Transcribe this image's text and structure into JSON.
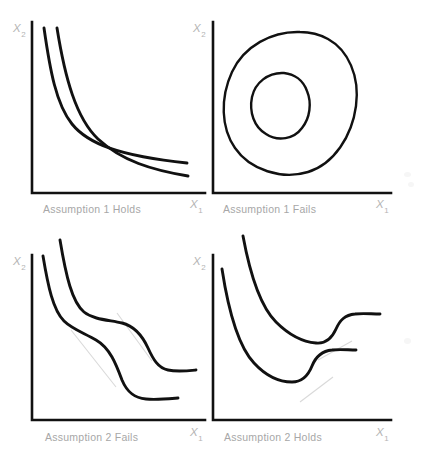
{
  "figure": {
    "background_color": "#ffffff",
    "curve_color": "#111111",
    "axis_color": "#111111",
    "label_color": "#b4b4b4",
    "caption_color": "#a7a7a7",
    "chord_color": "#d9d9d9",
    "layout": "2x2 grid"
  },
  "axis_labels": {
    "x_variable": "X",
    "x_subscript": "1",
    "y_variable": "X",
    "y_subscript": "2"
  },
  "panels": [
    {
      "id": "top-left",
      "caption": "Assumption 1 Holds",
      "x_axis_label": "X",
      "x_axis_subscript": "1",
      "y_axis_label": "X",
      "y_axis_subscript": "2",
      "curve_count": 2,
      "curve_type": "convex-decreasing",
      "description": "Two downward sloping curves convex to the origin"
    },
    {
      "id": "top-right",
      "caption": "Assumption 1 Fails",
      "x_axis_label": "X",
      "x_axis_subscript": "1",
      "y_axis_label": "X",
      "y_axis_subscript": "2",
      "curve_count": 2,
      "curve_type": "closed-loop",
      "description": "Two nested closed loops indicating a satiation point"
    },
    {
      "id": "bottom-left",
      "caption": "Assumption 2 Fails",
      "x_axis_label": "X",
      "x_axis_subscript": "1",
      "y_axis_label": "X",
      "y_axis_subscript": "2",
      "curve_count": 2,
      "curve_type": "non-convex-wavy",
      "description": "Two wavy decreasing curves with chords lying outside the curve"
    },
    {
      "id": "bottom-right",
      "caption": "Assumption 2 Holds",
      "x_axis_label": "X",
      "x_axis_subscript": "1",
      "y_axis_label": "X",
      "y_axis_subscript": "2",
      "curve_count": 2,
      "curve_type": "u-shaped",
      "description": "Two U shaped curves that fall then rise with chords above the curve"
    }
  ]
}
